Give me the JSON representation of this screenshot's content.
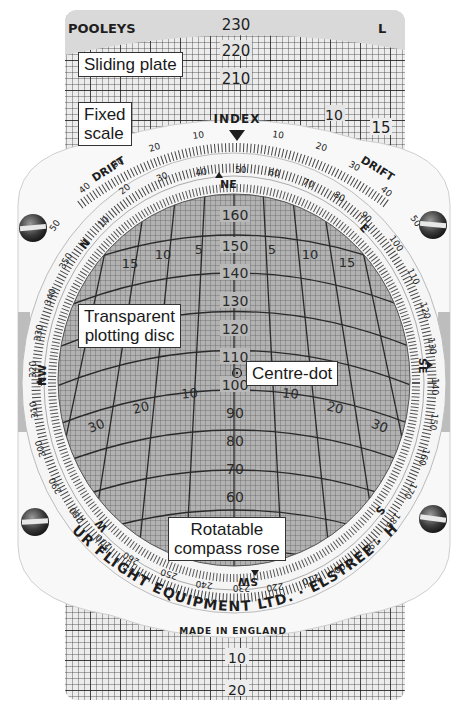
{
  "device": {
    "brand": "POOLEYS",
    "plate_side_marker": "L",
    "manufacturer_text": "AIRTOUR FLIGHT EQUIPMENT LTD. · ELSTREE · HERTS.",
    "origin_text": "MADE IN ENGLAND",
    "index_label": "INDEX",
    "drift_label": "DRIFT"
  },
  "callouts": {
    "sliding_plate": "Sliding plate",
    "fixed_scale_line1": "Fixed",
    "fixed_scale_line2": "scale",
    "transparent_disc_line1": "Transparent",
    "transparent_disc_line2": "plotting disc",
    "centre_dot": "Centre-dot",
    "compass_rose_line1": "Rotatable",
    "compass_rose_line2": "compass rose"
  },
  "sliding_plate_scale": {
    "top_values": [
      "230",
      "220",
      "210"
    ],
    "bottom_values": [
      "10",
      "20"
    ],
    "side_values_left": [
      "0"
    ],
    "side_values_right": [
      "10",
      "15"
    ]
  },
  "drift_scale": {
    "left": [
      "10",
      "20",
      "30",
      "40",
      "50"
    ],
    "right": [
      "10",
      "20",
      "30",
      "40",
      "50"
    ]
  },
  "compass_rose": {
    "cardinal": [
      "N",
      "NE",
      "E",
      "SE",
      "S",
      "SW",
      "W",
      "NW"
    ],
    "degree_labels": [
      "10",
      "20",
      "30",
      "40",
      "50",
      "60",
      "70",
      "80",
      "90",
      "100",
      "110",
      "120",
      "130",
      "140",
      "150",
      "160",
      "170",
      "180",
      "190",
      "200",
      "210",
      "220",
      "230",
      "240",
      "250",
      "260",
      "270",
      "280",
      "290",
      "300",
      "310",
      "320",
      "330",
      "340",
      "350"
    ]
  },
  "plotting_disc": {
    "speed_labels": [
      "160",
      "150",
      "140",
      "130",
      "120",
      "110",
      "100",
      "90",
      "80",
      "70",
      "60"
    ],
    "drift_arc_labels_upper": [
      "15",
      "10",
      "5",
      "5",
      "10",
      "15"
    ],
    "drift_arc_labels_lower": [
      "30",
      "20",
      "10",
      "10",
      "20",
      "30"
    ]
  },
  "colors": {
    "background": "#ffffff",
    "plate_band": "#d9d9d9",
    "plate_grid_bg": "#e4e4e4",
    "disc_white": "#f7f7f7",
    "plotting_disc": "#a9a9a9",
    "ink": "#1e1e1e"
  }
}
